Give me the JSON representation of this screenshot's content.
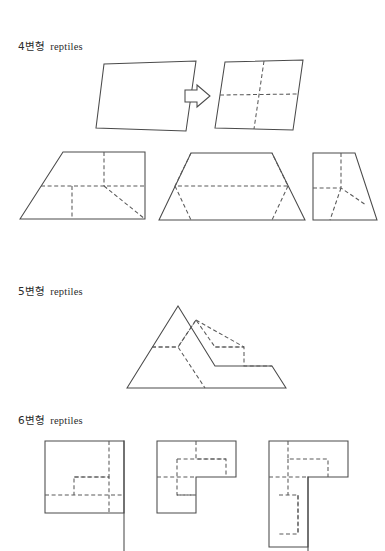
{
  "document": {
    "background_color": "#ffffff",
    "line_color": "#4a4a4a",
    "dash_color": "#5a5a5a",
    "text_color": "#2b2b2b"
  },
  "sections": [
    {
      "id": "quadrilateral",
      "label_hangul": "4변형",
      "label_roman": "reptiles",
      "label_full": "4변형 reptiles"
    },
    {
      "id": "pentagon",
      "label_hangul": "5변형",
      "label_roman": "reptiles",
      "label_full": "5변형 reptiles"
    },
    {
      "id": "hexagon",
      "label_hangul": "6변형",
      "label_roman": "reptiles",
      "label_full": "6변형 reptiles"
    }
  ],
  "figures": {
    "parallelogram_plain": {
      "name": "parallelogram-undivided",
      "outline": "104,64 196,61 186,131 96,128",
      "divisions": []
    },
    "arrow": {
      "name": "transformation-arrow",
      "glyph": "right-arrow",
      "points": "185,93 197,93 197,88 209,96 197,104 197,99 185,99"
    },
    "parallelogram_divided": {
      "name": "parallelogram-divided-into-4",
      "outline": "225,62 303,60 293,130 215,128",
      "divisions": [
        "264,61 254,129",
        "220,95 298,95"
      ]
    },
    "right_trapezoid": {
      "name": "right-trapezoid-divided-into-4",
      "outline": "20,219 63,152 145,152 145,219",
      "divisions": [
        "41,186 145,186",
        "104,152 104,186",
        "104,186 145,219",
        "72,186 72,219"
      ]
    },
    "isosceles_trapezoid": {
      "name": "isosceles-trapezoid-divided-into-4",
      "outline": "159,220 191,153 272,153 305,220"
    },
    "tall_trapezoid": {
      "name": "tall-right-trapezoid-divided-into-4",
      "outline": "313,153 355,153 377,220 313,220"
    },
    "pentagon_figure": {
      "name": "pentagon-sphinx-divided-into-4",
      "outline": "127,388 178,306 215,366 272,366 286,388"
    },
    "hexagon_left": {
      "name": "hexagon-L-shape-left",
      "outline": "45,441 124,441 124,513 45,513"
    },
    "hexagon_middle": {
      "name": "hexagon-L-shape-middle",
      "outline": "157,441 236,441 236,477 196,477 196,513 157,513"
    },
    "hexagon_right": {
      "name": "hexagon-L-shape-right",
      "outline": "269,441 348,441 348,477 308,477 308,547 269,547"
    }
  }
}
